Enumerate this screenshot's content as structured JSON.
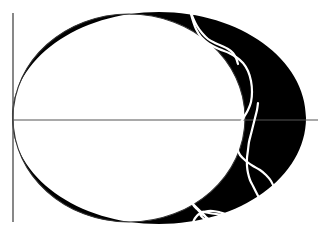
{
  "figure": {
    "title": "",
    "caption": "",
    "width": 322,
    "height": 235,
    "background_color": "#ffffff"
  },
  "colors": {
    "background": "#ffffff",
    "shape_fill": "#000000",
    "axis_line": "#555555",
    "inner_curve_stroke": "#333333",
    "white_curve_stroke": "#ffffff"
  },
  "axes": {
    "origin": {
      "x": 13,
      "y": 120
    },
    "horizontal": {
      "x1": 13,
      "y1": 120,
      "x2": 318,
      "y2": 120,
      "stroke_width": 1.1
    },
    "vertical": {
      "x1": 13,
      "y1": 13,
      "x2": 13,
      "y2": 222,
      "stroke_width": 1.4
    },
    "tick_labels_x": [],
    "tick_labels_y": [],
    "xlabel": "",
    "ylabel": ""
  },
  "chart_data": {
    "type": "line",
    "title": "",
    "subtitle": "",
    "xlabel": "",
    "ylabel": "",
    "grid": false,
    "legend": [],
    "annotations": [],
    "xlim": [
      13,
      318
    ],
    "ylim": [
      13,
      222
    ],
    "regions": [
      {
        "name": "outer-boundary-ellipse",
        "description": "Large ellipse forming outer edge of filled black crescent",
        "center": [
          159,
          118
        ],
        "radius_x": 147,
        "radius_y": 106
      },
      {
        "name": "inner-boundary-ovoid",
        "description": "Egg-shaped inner curve; interior is white, crescent is the gap to the outer ellipse",
        "center": [
          129,
          118
        ],
        "radius_x": 116,
        "radius_y": 104
      }
    ],
    "series": [
      {
        "name": "white-curve-main",
        "color": "#ffffff",
        "stroke_width": 2.2,
        "x": [
          190,
          191,
          193,
          196,
          201,
          209,
          219,
          229,
          236,
          243,
          248,
          251,
          252,
          251,
          248,
          244,
          240,
          237,
          236,
          237,
          240,
          246,
          253,
          260,
          266,
          271,
          274,
          275,
          274,
          271,
          266,
          259,
          251,
          242,
          233,
          224,
          216,
          209,
          204,
          201,
          200,
          202,
          206,
          211,
          214,
          214,
          211,
          206,
          201,
          197,
          194,
          193,
          194,
          197,
          201,
          205,
          208,
          209
        ],
        "y": [
          9,
          14,
          21,
          29,
          37,
          44,
          49,
          53,
          57,
          63,
          71,
          81,
          92,
          102,
          110,
          117,
          124,
          132,
          140,
          148,
          155,
          161,
          166,
          170,
          175,
          181,
          188,
          195,
          201,
          206,
          210,
          213,
          215,
          216,
          216,
          215,
          214,
          213,
          212,
          212,
          214,
          217,
          220,
          223,
          225,
          224,
          221,
          217,
          213,
          209,
          206,
          204,
          205,
          208,
          212,
          216,
          220,
          224
        ]
      },
      {
        "name": "white-curve-secondary",
        "color": "#ffffff",
        "stroke_width": 2.2,
        "x": [
          258,
          257,
          255,
          253,
          251,
          249,
          248,
          247,
          247,
          248,
          250,
          253,
          256,
          259,
          261,
          262,
          262,
          260,
          257,
          252,
          246,
          239,
          232,
          225,
          219,
          213,
          208,
          203,
          199,
          196,
          194,
          193,
          193,
          195,
          198
        ],
        "y": [
          103,
          110,
          118,
          126,
          134,
          142,
          150,
          158,
          166,
          173,
          180,
          186,
          192,
          198,
          204,
          209,
          213,
          216,
          218,
          219,
          219,
          218,
          216,
          214,
          212,
          211,
          211,
          212,
          214,
          217,
          220,
          223,
          226,
          228,
          230
        ]
      },
      {
        "name": "white-curve-upper-branch",
        "color": "#ffffff",
        "stroke_width": 2.2,
        "x": [
          190,
          193,
          197,
          202,
          208,
          215,
          222,
          228,
          233,
          236,
          238
        ],
        "y": [
          9,
          18,
          26,
          33,
          39,
          43,
          46,
          49,
          53,
          58,
          64
        ]
      }
    ]
  },
  "elements": {
    "figure_label": "crescent-lune-diagram",
    "description": "Black crescent (lune) region bounded by an outer ellipse and an inner ovoid, overlaid with white oscillating curves, drawn over a pair of coordinate axis lines."
  }
}
